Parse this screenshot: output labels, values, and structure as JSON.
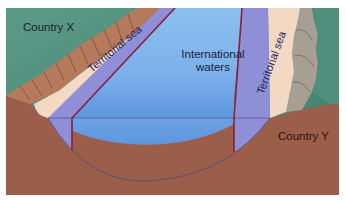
{
  "diagram": {
    "labels": {
      "country_x": "Country X",
      "country_y": "Country Y",
      "international_waters_line1": "International",
      "international_waters_line2": "waters",
      "territorial_sea_left": "Territorial sea",
      "territorial_sea_right": "Territorial sea"
    },
    "colors": {
      "land_green": "#4f8f7c",
      "seabed_brown": "#9a5e4a",
      "beach_sand": "#f3d9c4",
      "cliff_brown": "#b57a5c",
      "rock_gray": "#a79e94",
      "territorial_sea": "#8f8fd8",
      "international_water": "#7fb4ec",
      "boundary_line": "#8a1f3a"
    }
  }
}
